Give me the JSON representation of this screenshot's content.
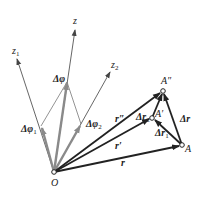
{
  "diagram": {
    "colors": {
      "axis": "#555555",
      "rotation_vec": "#8a8a8a",
      "position_vec": "#222222",
      "background": "#ffffff"
    },
    "points": {
      "O": {
        "label": "O",
        "x": 54,
        "y": 172
      },
      "A": {
        "label": "A",
        "x": 182,
        "y": 145
      },
      "A_prime": {
        "label": "A′",
        "x": 152,
        "y": 118
      },
      "A_dprime": {
        "label": "A″",
        "x": 163,
        "y": 91
      }
    },
    "axes": {
      "z": {
        "label": "z",
        "tip_x": 75,
        "tip_y": 28
      },
      "z1": {
        "label": "z",
        "sub": "1",
        "tip_x": 17,
        "tip_y": 57
      },
      "z2": {
        "label": "z",
        "sub": "2",
        "tip_x": 111,
        "tip_y": 70
      }
    },
    "rotation_vectors": {
      "dphi": {
        "label": "Δφ",
        "sub": "",
        "tip_x": 67,
        "tip_y": 82
      },
      "dphi1": {
        "label": "Δφ",
        "sub": "1",
        "tip_x": 41,
        "tip_y": 126
      },
      "dphi2": {
        "label": "Δφ",
        "sub": "2",
        "tip_x": 81,
        "tip_y": 124
      }
    },
    "position_vectors": {
      "r": {
        "label": "r"
      },
      "r_prime": {
        "label": "r′"
      },
      "r_dprime": {
        "label": "r″"
      }
    },
    "displacements": {
      "dr": {
        "label": "Δr",
        "sub": ""
      },
      "dr1": {
        "label": "Δr",
        "sub": "1"
      },
      "dr2": {
        "label": "Δr",
        "sub": "2"
      }
    }
  }
}
